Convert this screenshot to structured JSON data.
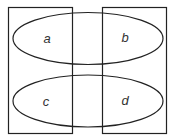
{
  "diagram": {
    "type": "set-diagram",
    "regions": [
      {
        "id": "a",
        "label": "a"
      },
      {
        "id": "b",
        "label": "b"
      },
      {
        "id": "c",
        "label": "c"
      },
      {
        "id": "d",
        "label": "d"
      }
    ],
    "stroke_color": "#222222",
    "label_color": "#333333"
  }
}
